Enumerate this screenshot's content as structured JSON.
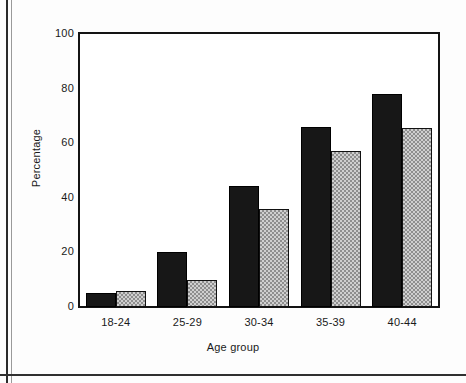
{
  "chart_data": {
    "type": "bar",
    "title": "",
    "subtitle": "",
    "xlabel": "Age group",
    "ylabel": "Percentage",
    "categories": [
      "18-24",
      "25-29",
      "30-34",
      "35-39",
      "40-44"
    ],
    "series": [
      {
        "name": "series-1-dark",
        "values": [
          5,
          20,
          44.5,
          66,
          78
        ]
      },
      {
        "name": "series-2-light",
        "values": [
          6,
          10,
          36,
          57,
          65.5
        ]
      }
    ],
    "ylim": [
      0,
      100
    ],
    "yticks": [
      0,
      20,
      40,
      60,
      80,
      100
    ],
    "ytick_labels": [
      "0",
      "20",
      "40",
      "60",
      "80",
      "100"
    ],
    "grid": false,
    "legend": "none",
    "annotations": []
  },
  "axis": {
    "y_title": "Percentage",
    "x_title": "Age group"
  },
  "colors": {
    "series_dark": "#171717",
    "series_light": "#cfcfcf",
    "axis_line": "#141414",
    "text": "#1a1a1a",
    "background": "#ffffff"
  }
}
